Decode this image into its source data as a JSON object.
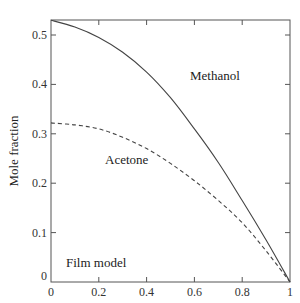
{
  "chart_data": {
    "type": "line",
    "title": "",
    "xlabel": "",
    "ylabel": "Mole fraction",
    "xlim": [
      0,
      1
    ],
    "ylim": [
      0,
      0.53
    ],
    "grid": false,
    "legend": null,
    "x_ticks": [
      0,
      0.2,
      0.4,
      0.6,
      0.8,
      1
    ],
    "x_tick_labels": [
      "0",
      "0.2",
      "0.4",
      "0.6",
      "0.8",
      "1"
    ],
    "y_ticks": [
      0,
      0.1,
      0.2,
      0.3,
      0.4,
      0.5
    ],
    "y_tick_labels": [
      "0",
      "0.1",
      "0.2",
      "0.3",
      "0.4",
      "0.5"
    ],
    "x": [
      0,
      0.1,
      0.2,
      0.3,
      0.4,
      0.5,
      0.6,
      0.7,
      0.8,
      0.9,
      1.0
    ],
    "series": [
      {
        "name": "Methanol",
        "style": "solid",
        "values": [
          0.53,
          0.516,
          0.495,
          0.465,
          0.425,
          0.373,
          0.31,
          0.242,
          0.165,
          0.085,
          0.0
        ]
      },
      {
        "name": "Acetone",
        "style": "dashed",
        "values": [
          0.322,
          0.318,
          0.31,
          0.293,
          0.27,
          0.24,
          0.205,
          0.165,
          0.12,
          0.063,
          0.0
        ]
      }
    ],
    "annotations": [
      {
        "text": "Methanol",
        "x": 0.65,
        "y": 0.42
      },
      {
        "text": "Acetone",
        "x": 0.25,
        "y": 0.245
      },
      {
        "text": "Film model",
        "x": 0.05,
        "y": 0.038
      }
    ]
  }
}
